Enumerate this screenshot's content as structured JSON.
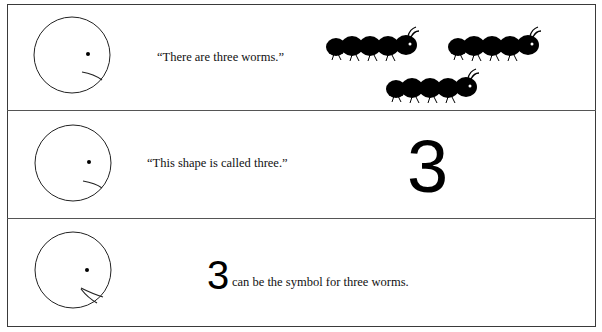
{
  "panels": [
    {
      "face": "smiling-face-closed-mouth",
      "caption": "“There are three worms.”",
      "illustration": "three-worms",
      "worm_count": 3
    },
    {
      "face": "smiling-face-closed-mouth",
      "caption": "“This shape is called three.”",
      "illustration": "numeral-three",
      "numeral": "3"
    },
    {
      "face": "face-open-mouth",
      "numeral": "3",
      "caption": "can be the symbol for three worms."
    }
  ]
}
